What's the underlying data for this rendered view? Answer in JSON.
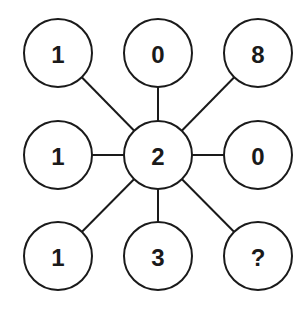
{
  "diagram": {
    "type": "number-puzzle",
    "center": {
      "value": "2",
      "cx": 158,
      "cy": 155
    },
    "radius": 34,
    "colors": {
      "stroke": "#1a1a1a",
      "fill": "#ffffff",
      "text": "#1a1a1a"
    },
    "nodes": [
      {
        "id": "top-left",
        "value": "1",
        "cx": 58,
        "cy": 53
      },
      {
        "id": "top-center",
        "value": "0",
        "cx": 158,
        "cy": 53
      },
      {
        "id": "top-right",
        "value": "8",
        "cx": 258,
        "cy": 53
      },
      {
        "id": "mid-left",
        "value": "1",
        "cx": 58,
        "cy": 155
      },
      {
        "id": "mid-right",
        "value": "0",
        "cx": 258,
        "cy": 155
      },
      {
        "id": "bottom-left",
        "value": "1",
        "cx": 58,
        "cy": 256
      },
      {
        "id": "bottom-center",
        "value": "3",
        "cx": 158,
        "cy": 256
      },
      {
        "id": "bottom-right",
        "value": "?",
        "cx": 258,
        "cy": 256
      }
    ],
    "edges": "center-to-each-outer-node"
  }
}
